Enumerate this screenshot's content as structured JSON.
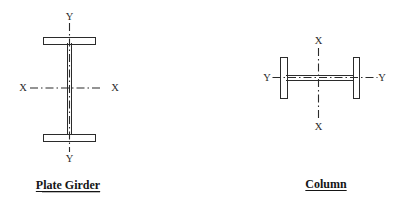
{
  "colors": {
    "ink": "#2b2b2b",
    "background": "#ffffff"
  },
  "plate_girder": {
    "caption": "Plate Girder",
    "axis_top_label": "Y",
    "axis_bottom_label": "Y",
    "axis_left_label": "X",
    "axis_right_label": "X"
  },
  "column": {
    "caption": "Column",
    "axis_top_label": "X",
    "axis_bottom_label": "X",
    "axis_left_label": "Y",
    "axis_right_label": "Y"
  }
}
